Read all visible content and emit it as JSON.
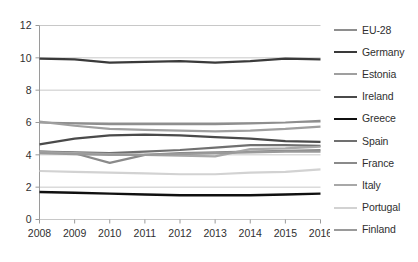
{
  "chart_data": {
    "type": "line",
    "title": "",
    "subtitle": "",
    "xlabel": "",
    "ylabel": "",
    "x": [
      2008,
      2009,
      2010,
      2011,
      2012,
      2013,
      2014,
      2015,
      2016
    ],
    "categories": [
      "2008",
      "2009",
      "2010",
      "2011",
      "2012",
      "2013",
      "2014",
      "2015",
      "2016"
    ],
    "xtick_labels": [
      "2008",
      "2009",
      "2010",
      "2011",
      "2012",
      "2013",
      "2014",
      "2015",
      "2016"
    ],
    "ytick_labels": [
      "0",
      "2",
      "4",
      "6",
      "8",
      "10",
      "12"
    ],
    "yticks": [
      0,
      2,
      4,
      6,
      8,
      10,
      12
    ],
    "ylim": [
      0,
      12
    ],
    "xlim": [
      2008,
      2016
    ],
    "grid": true,
    "grid_axis": "y",
    "legend_position": "right",
    "series": [
      {
        "name": "EU-28",
        "color": "#8e8e8e",
        "width": 2.2,
        "values": [
          6.0,
          5.95,
          5.9,
          5.9,
          5.9,
          5.9,
          5.95,
          6.0,
          6.1
        ]
      },
      {
        "name": "Germany",
        "color": "#3a3a3a",
        "width": 2.2,
        "values": [
          9.95,
          9.9,
          9.7,
          9.75,
          9.8,
          9.7,
          9.8,
          9.95,
          9.9
        ]
      },
      {
        "name": "Estonia",
        "color": "#9f9f9f",
        "width": 2.2,
        "values": [
          6.05,
          5.8,
          5.6,
          5.55,
          5.5,
          5.45,
          5.5,
          5.6,
          5.75
        ]
      },
      {
        "name": "Ireland",
        "color": "#4a4a4a",
        "width": 2.2,
        "values": [
          4.65,
          5.0,
          5.2,
          5.25,
          5.2,
          5.1,
          5.0,
          4.85,
          4.8
        ]
      },
      {
        "name": "Greece",
        "color": "#101010",
        "width": 2.4,
        "values": [
          1.7,
          1.65,
          1.6,
          1.55,
          1.5,
          1.5,
          1.5,
          1.55,
          1.6
        ]
      },
      {
        "name": "Spain",
        "color": "#707070",
        "width": 2.2,
        "values": [
          4.2,
          4.15,
          4.1,
          4.2,
          4.3,
          4.45,
          4.6,
          4.6,
          4.55
        ]
      },
      {
        "name": "France",
        "color": "#8a8a8a",
        "width": 2.2,
        "values": [
          4.2,
          4.1,
          3.5,
          4.0,
          4.1,
          4.15,
          4.2,
          4.25,
          4.3
        ]
      },
      {
        "name": "Italy",
        "color": "#a8a8a8",
        "width": 2.2,
        "values": [
          4.15,
          4.1,
          4.05,
          4.0,
          3.95,
          3.9,
          4.35,
          4.4,
          4.5
        ]
      },
      {
        "name": "Portugal",
        "color": "#d2d2d2",
        "width": 2.2,
        "values": [
          3.0,
          2.95,
          2.9,
          2.85,
          2.8,
          2.8,
          2.9,
          2.95,
          3.1
        ]
      },
      {
        "name": "Finland",
        "color": "#9a9a9a",
        "width": 2.2,
        "values": [
          4.1,
          4.05,
          4.0,
          4.0,
          4.05,
          4.1,
          4.15,
          4.2,
          4.2
        ]
      }
    ]
  },
  "legend": {
    "items": [
      {
        "label": "EU-28"
      },
      {
        "label": "Germany"
      },
      {
        "label": "Estonia"
      },
      {
        "label": "Ireland"
      },
      {
        "label": "Greece"
      },
      {
        "label": "Spain"
      },
      {
        "label": "France"
      },
      {
        "label": "Italy"
      },
      {
        "label": "Portugal"
      },
      {
        "label": "Finland"
      }
    ]
  },
  "colors": {
    "grid": "#c8c8c8",
    "axis": "#9a9a9a",
    "text": "#2f2f2f",
    "background": "#ffffff"
  }
}
